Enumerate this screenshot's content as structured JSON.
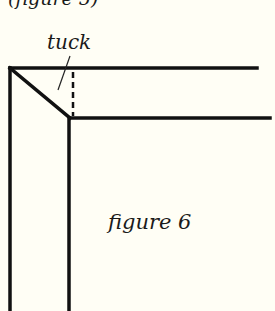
{
  "diagram": {
    "cut_text": "(figure 5)",
    "tuck_label": "tuck",
    "figure_label": "figure 6",
    "colors": {
      "background": "#fffef5",
      "line": "#111111"
    }
  }
}
